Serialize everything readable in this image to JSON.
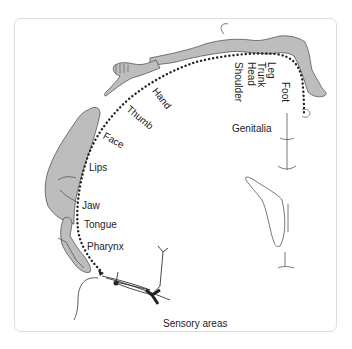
{
  "diagram": {
    "caption": "Sensory areas",
    "labels": {
      "genitalia": "Genitalia",
      "foot": "Foot",
      "leg": "Leg",
      "trunk": "Trunk",
      "head": "Head",
      "shoulder": "Shoulder",
      "hand": "Hand",
      "thumb": "Thumb",
      "face": "Face",
      "lips": "Lips",
      "jaw": "Jaw",
      "tongue": "Tongue",
      "pharynx": "Pharynx"
    },
    "colors": {
      "body_fill": "#bdbdbd",
      "outline": "#555555",
      "dots": "#222222",
      "frame": "#dedede"
    }
  }
}
